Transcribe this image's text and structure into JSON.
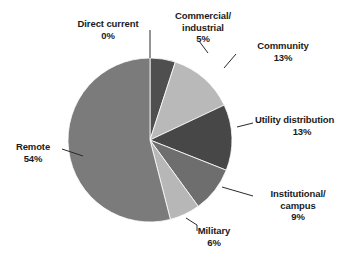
{
  "chart_data": {
    "type": "pie",
    "title": "",
    "subtitle": "",
    "xlabel": "",
    "ylabel": "",
    "legend_position": "none",
    "grid": false,
    "labels_show_percent": true,
    "start_angle_deg": 0,
    "direction": "clockwise",
    "categories": [
      "Direct current",
      "Commercial/ industrial",
      "Community",
      "Utility distribution",
      "Institutional/ campus",
      "Military",
      "Remote"
    ],
    "values": [
      0,
      5,
      13,
      13,
      9,
      6,
      54
    ],
    "value_labels": [
      "0%",
      "5%",
      "13%",
      "13%",
      "9%",
      "6%",
      "54%"
    ],
    "colors": [
      "#8a8a8a",
      "#4f4f4f",
      "#b9b9b9",
      "#474747",
      "#6e6e6e",
      "#b7b7b7",
      "#7b7b7b"
    ],
    "slices": [
      {
        "name": "Direct current",
        "name_lines": [
          "Direct current"
        ],
        "value": 0,
        "percent_label": "0%",
        "color": "#8a8a8a",
        "leader": "straight-down"
      },
      {
        "name": "Commercial/ industrial",
        "name_lines": [
          "Commercial/",
          "Industrial"
        ],
        "value": 5,
        "percent_label": "5%",
        "color": "#4f4f4f",
        "leader": "elbow-left"
      },
      {
        "name": "Community",
        "name_lines": [
          "Community"
        ],
        "value": 13,
        "percent_label": "13%",
        "color": "#b9b9b9",
        "leader": "elbow-left"
      },
      {
        "name": "Utility distribution",
        "name_lines": [
          "Utility distribution"
        ],
        "value": 13,
        "percent_label": "13%",
        "color": "#474747",
        "leader": "elbow-left"
      },
      {
        "name": "Institutional/ campus",
        "name_lines": [
          "Institutional/",
          "campus"
        ],
        "value": 9,
        "percent_label": "9%",
        "color": "#6e6e6e",
        "leader": "elbow-left"
      },
      {
        "name": "Military",
        "name_lines": [
          "Military"
        ],
        "value": 6,
        "percent_label": "6%",
        "color": "#b7b7b7",
        "leader": "elbow-right"
      },
      {
        "name": "Remote",
        "name_lines": [
          "Remote"
        ],
        "value": 54,
        "percent_label": "54%",
        "color": "#7b7b7b",
        "leader": "elbow-right"
      }
    ],
    "total": 100,
    "units": "percent",
    "geometry": {
      "center_x": 150,
      "center_y": 140,
      "radius": 82
    }
  },
  "labels": {
    "direct_current": {
      "line1": "Direct current",
      "pct": "0%"
    },
    "commercial": {
      "line1": "Commercial/",
      "line2": "industrial",
      "pct": "5%"
    },
    "community": {
      "line1": "Community",
      "pct": "13%"
    },
    "utility": {
      "line1": "Utility distribution",
      "pct": "13%"
    },
    "institutional": {
      "line1": "Institutional/",
      "line2": "campus",
      "pct": "9%"
    },
    "military": {
      "line1": "Military",
      "pct": "6%"
    },
    "remote": {
      "line1": "Remote",
      "pct": "54%"
    }
  }
}
